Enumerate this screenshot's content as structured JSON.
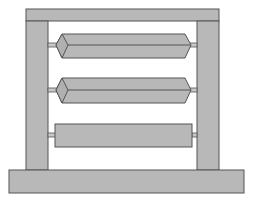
{
  "figure": {
    "colors": {
      "fill": "#b8b8b8",
      "stroke": "#555555",
      "background": "#ffffff",
      "axle": "#c8c8c8"
    },
    "frame": {
      "top_bar": {
        "x": 26,
        "y": 9,
        "w": 193,
        "h": 12
      },
      "left_post": {
        "x": 26,
        "y": 21,
        "w": 22,
        "h": 149
      },
      "right_post": {
        "x": 197,
        "y": 21,
        "w": 22,
        "h": 149
      },
      "base": {
        "x": 9,
        "y": 170,
        "w": 235,
        "h": 23
      }
    },
    "rollers": [
      {
        "type": "hexagonal-prism",
        "cy": 45
      },
      {
        "type": "hexagonal-prism",
        "cy": 90
      },
      {
        "type": "cylinder",
        "cy": 135
      }
    ]
  }
}
